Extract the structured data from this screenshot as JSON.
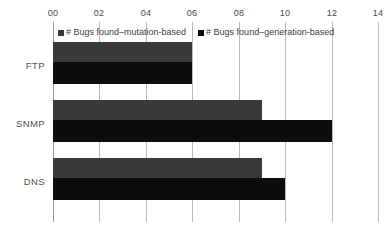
{
  "chart_data": {
    "type": "bar",
    "orientation": "horizontal",
    "title": "",
    "xlabel": "",
    "ylabel": "",
    "xlim": [
      0,
      14
    ],
    "xticks": [
      0,
      2,
      4,
      6,
      8,
      10,
      12,
      14
    ],
    "xtick_labels": [
      "00",
      "02",
      "04",
      "06",
      "08",
      "10",
      "12",
      "14"
    ],
    "categories": [
      "FTP",
      "SNMP",
      "DNS"
    ],
    "grid": true,
    "legend_position": "top-inside",
    "series": [
      {
        "name": "# Bugs found–mutation-based",
        "color": "#3a3a3a",
        "values": [
          6,
          9,
          9
        ]
      },
      {
        "name": "# Bugs found–generation-based",
        "color": "#0d0d0d",
        "values": [
          6,
          12,
          10
        ]
      }
    ]
  }
}
